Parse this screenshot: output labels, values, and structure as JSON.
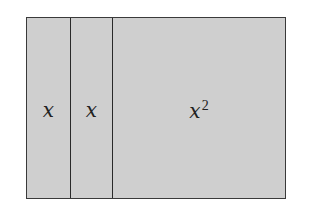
{
  "diagram": {
    "regions": [
      {
        "label": "x"
      },
      {
        "label": "x"
      },
      {
        "label": "x",
        "exponent": "2"
      }
    ],
    "colors": {
      "fill": "#cfcfcf",
      "border": "#2a2a2a"
    }
  }
}
